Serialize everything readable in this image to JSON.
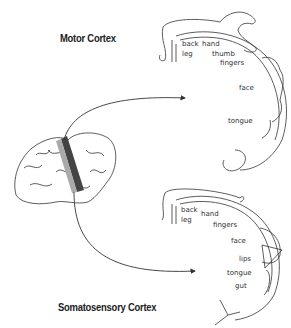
{
  "motor": {
    "title": "Motor Cortex",
    "labels": {
      "back": "back",
      "hand": "hand",
      "leg": "leg",
      "thumb": "thumb",
      "fingers": "fingers",
      "face": "face",
      "tongue": "tongue"
    }
  },
  "somato": {
    "title": "Somatosensory Cortex",
    "labels": {
      "back": "back",
      "hand": "hand",
      "leg": "leg",
      "fingers": "fingers",
      "face": "face",
      "lips": "lips",
      "tongue": "tongue",
      "gut": "gut"
    }
  },
  "colors": {
    "line": "#333333",
    "motor_strip": "#444444",
    "sensory_strip": "#aaaaaa"
  }
}
